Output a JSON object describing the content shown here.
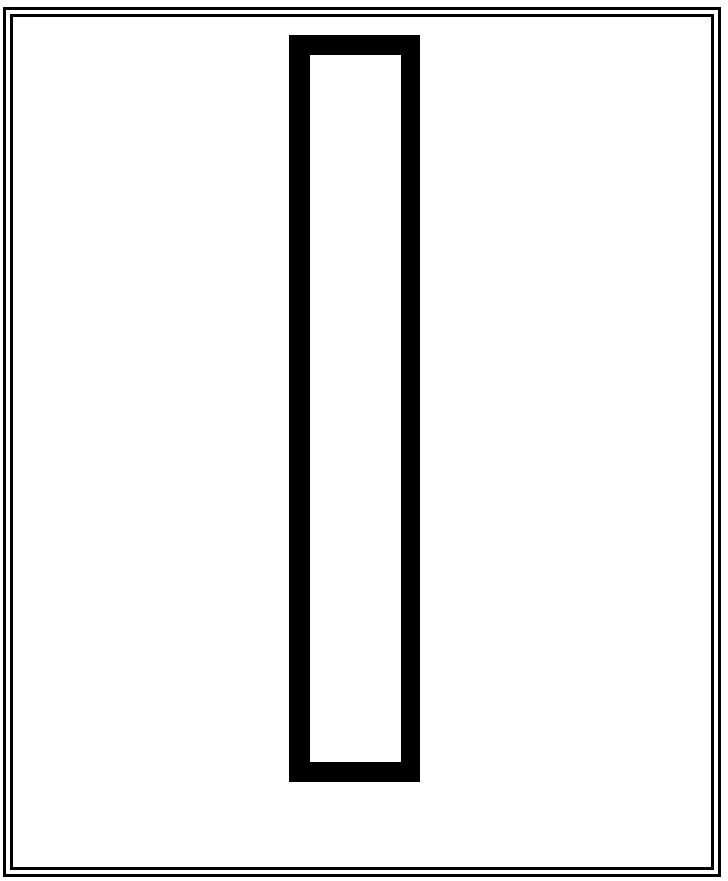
{
  "page": {
    "background_color": "#ffffff"
  },
  "border": {
    "style": "double-line",
    "color": "#000000"
  },
  "shape": {
    "type": "hollow-rectangle",
    "orientation": "vertical",
    "stroke_color": "#000000",
    "fill_color": "#ffffff"
  }
}
